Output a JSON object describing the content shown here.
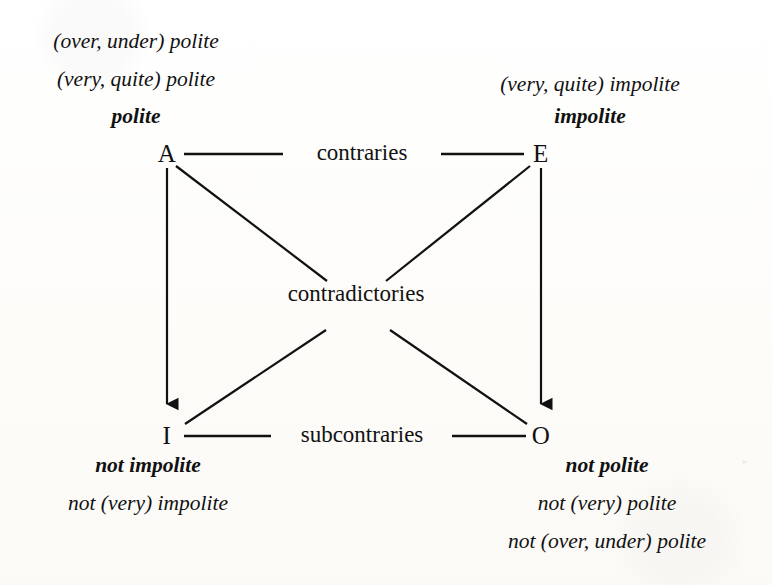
{
  "figure": {
    "type": "square-of-opposition",
    "background_color": "#fdfdfb",
    "ink_color": "#111111"
  },
  "vertices": {
    "a": "A",
    "e": "E",
    "i": "I",
    "o": "O"
  },
  "relations": {
    "top": "contraries",
    "diagonal": "contradictories",
    "bottom": "subcontraries"
  },
  "glosses": {
    "top_left": {
      "line1": "(over, under) polite",
      "line2": "(very, quite) polite",
      "line3": "polite"
    },
    "top_right": {
      "line1": "(very, quite) impolite",
      "line2": "impolite"
    },
    "bottom_left": {
      "line1": "not impolite",
      "line2": "not (very) impolite"
    },
    "bottom_right": {
      "line1": "not polite",
      "line2": "not (very) polite",
      "line3": "not (over, under) polite"
    }
  }
}
